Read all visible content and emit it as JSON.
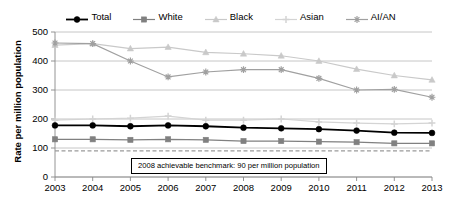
{
  "chart_data": {
    "type": "line",
    "title": "",
    "xlabel": "",
    "ylabel": "Rate per million population",
    "categories": [
      "2003",
      "2004",
      "2005",
      "2006",
      "2007",
      "2008",
      "2009",
      "2010",
      "2011",
      "2012",
      "2013"
    ],
    "ylim": [
      0,
      500
    ],
    "ytick_values": [
      0,
      100,
      200,
      300,
      400,
      500
    ],
    "ytick_labels": [
      "0",
      "100",
      "200",
      "300",
      "400",
      "500"
    ],
    "grid": true,
    "legend_position": "top",
    "series": [
      {
        "name": "Total",
        "marker": "circle",
        "color": "#000000",
        "values": [
          178,
          178,
          175,
          178,
          175,
          170,
          168,
          165,
          160,
          153,
          152
        ]
      },
      {
        "name": "White",
        "marker": "square",
        "color": "#808080",
        "values": [
          130,
          130,
          128,
          130,
          128,
          124,
          124,
          122,
          120,
          116,
          116
        ]
      },
      {
        "name": "Black",
        "marker": "triangle",
        "color": "#c9c9c9",
        "values": [
          455,
          460,
          443,
          448,
          430,
          425,
          418,
          400,
          372,
          350,
          335
        ]
      },
      {
        "name": "Asian",
        "marker": "plus",
        "color": "#d4d4d4",
        "values": [
          196,
          200,
          203,
          210,
          196,
          196,
          200,
          190,
          186,
          183,
          186
        ]
      },
      {
        "name": "AI/AN",
        "marker": "asterisk",
        "color": "#a0a0a0",
        "values": [
          462,
          460,
          400,
          345,
          362,
          370,
          370,
          340,
          300,
          302,
          275
        ]
      }
    ],
    "annotations": [
      {
        "name": "achievable-benchmark",
        "text": "2008 achievable benchmark: 90 per million population",
        "value": 90,
        "style": "dashed-line-with-label-box"
      }
    ]
  },
  "legend": {
    "items": [
      {
        "label": "Total",
        "marker": "circle",
        "color": "#000000"
      },
      {
        "label": "White",
        "marker": "square",
        "color": "#808080"
      },
      {
        "label": "Black",
        "marker": "triangle",
        "color": "#c9c9c9"
      },
      {
        "label": "Asian",
        "marker": "plus",
        "color": "#d4d4d4"
      },
      {
        "label": "AI/AN",
        "marker": "asterisk",
        "color": "#a0a0a0"
      }
    ]
  }
}
